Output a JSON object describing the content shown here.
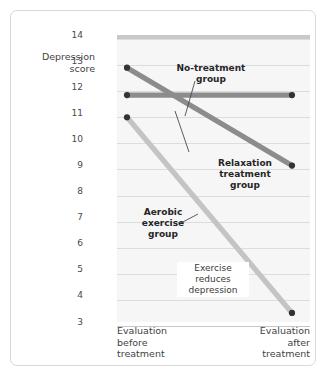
{
  "chart_data": {
    "type": "line",
    "title": "",
    "xlabel": "",
    "ylabel": "Depression\nscore",
    "ylim": [
      3,
      14
    ],
    "grid": true,
    "legend_position": "inline-annotations",
    "categories": [
      "Evaluation before treatment",
      "Evaluation after treatment"
    ],
    "x_tick_labels": [
      "Evaluation\nbefore\ntreatment",
      "Evaluation\nafter\ntreatment"
    ],
    "y_tick_labels": [
      "14",
      "13",
      "12",
      "11",
      "10",
      "9",
      "8",
      "7",
      "6",
      "5",
      "4",
      "3"
    ],
    "y_ticks": [
      14,
      13,
      12,
      11,
      10,
      9,
      8,
      7,
      6,
      5,
      4,
      3
    ],
    "series": [
      {
        "name": "No-treatment group",
        "values": [
          11.85,
          11.85
        ],
        "color": "#8c8c8c",
        "marker": "circle",
        "marker_color": "#333333"
      },
      {
        "name": "Relaxation treatment group",
        "values": [
          12.9,
          9.15
        ],
        "color": "#8c8c8c",
        "marker": "circle",
        "marker_color": "#333333"
      },
      {
        "name": "Aerobic exercise group",
        "values": [
          11.0,
          3.5
        ],
        "color": "#c4c4c4",
        "marker": "circle",
        "marker_color": "#333333"
      }
    ],
    "annotations": [
      {
        "id": "no-treatment",
        "text": "No-treatment\ngroup",
        "style": "bold"
      },
      {
        "id": "relaxation",
        "text": "Relaxation\ntreatment\ngroup",
        "style": "bold"
      },
      {
        "id": "aerobic",
        "text": "Aerobic\nexercise\ngroup",
        "style": "bold"
      },
      {
        "id": "exercise-note",
        "text": "Exercise\nreduces\ndepression",
        "style": "plain"
      }
    ],
    "colors": {
      "plot_background": "#f6f6f6",
      "gridline": "#dcdcdc",
      "frame_border": "#d9d9d9",
      "top_band": "#c9c9c9",
      "dark_series": "#8c8c8c",
      "light_series": "#c4c4c4",
      "marker": "#333333"
    }
  }
}
